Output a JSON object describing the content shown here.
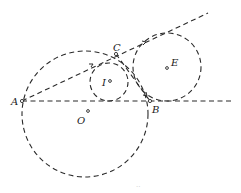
{
  "figure": {
    "type": "geometry-diagram",
    "points": {
      "A": {
        "label": "A",
        "x": 22,
        "y": 101
      },
      "B": {
        "label": "B",
        "x": 150,
        "y": 101
      },
      "C": {
        "label": "C",
        "x": 116,
        "y": 54
      },
      "O": {
        "label": "O",
        "x": 85,
        "y": 114
      },
      "I": {
        "label": "I",
        "x": 109,
        "y": 82
      },
      "E": {
        "label": "E",
        "x": 167,
        "y": 67
      }
    },
    "circles": [
      {
        "name": "circumcircle",
        "center": "O",
        "r": 63
      },
      {
        "name": "incircle",
        "center": "I",
        "r": 19
      },
      {
        "name": "excircle",
        "center": "E",
        "r": 34
      }
    ],
    "lines": [
      {
        "name": "ray-AC-extended",
        "from": "A",
        "to_x": 208,
        "to_y": 13
      },
      {
        "name": "ray-AB-extended",
        "from": "A",
        "to_x": 233,
        "to_y": 101
      },
      {
        "name": "segment-CB",
        "from": "C",
        "to": "B"
      }
    ],
    "labels": {
      "A": "A",
      "B": "B",
      "C": "C",
      "O": "O",
      "I": "I",
      "E": "E"
    },
    "caption_mark": "··"
  },
  "colors": {
    "stroke": "#2a2a2a",
    "background": "#ffffff"
  }
}
